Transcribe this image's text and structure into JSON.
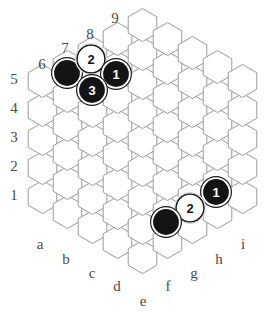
{
  "board": {
    "title": "Hex board diagram",
    "shape": "hexagonal",
    "side_length": 5,
    "column_count": 9,
    "columns": [
      "a",
      "b",
      "c",
      "d",
      "e",
      "f",
      "g",
      "h",
      "i"
    ],
    "column_labels": [
      {
        "label": "a",
        "x": 40,
        "y": 246
      },
      {
        "label": "b",
        "x": 66,
        "y": 261
      },
      {
        "label": "c",
        "x": 92,
        "y": 275
      },
      {
        "label": "d",
        "x": 117,
        "y": 288
      },
      {
        "label": "e",
        "x": 143,
        "y": 303
      },
      {
        "label": "f",
        "x": 168,
        "y": 288
      },
      {
        "label": "g",
        "x": 194,
        "y": 275
      },
      {
        "label": "h",
        "x": 219,
        "y": 261
      },
      {
        "label": "i",
        "x": 243,
        "y": 246
      }
    ],
    "row_labels": [
      {
        "label": "1",
        "x": 14,
        "y": 197
      },
      {
        "label": "2",
        "x": 14,
        "y": 168
      },
      {
        "label": "3",
        "x": 14,
        "y": 139
      },
      {
        "label": "4",
        "x": 14,
        "y": 110
      },
      {
        "label": "5",
        "x": 14,
        "y": 81
      },
      {
        "label": "6",
        "x": 42,
        "y": 66
      },
      {
        "label": "7",
        "x": 65,
        "y": 50
      },
      {
        "label": "8",
        "x": 90,
        "y": 36
      },
      {
        "label": "9",
        "x": 115,
        "y": 20
      }
    ],
    "grid_geometry": {
      "hex_radius": 16.5,
      "hex_width": 28.6,
      "column_step_x": 25.3,
      "row_step_y": 29.2,
      "origin_x": 42.5,
      "origin_y": 197
    },
    "colors": {
      "background": "#ffffff",
      "cell_fill": "#ffffff",
      "cell_stroke": "#9a9a9a",
      "label": "#4a4a4a",
      "black_stone": "#141414",
      "white_stone": "#ffffff",
      "stone_border": "#1a1a1a"
    },
    "stones": [
      {
        "id": "stone-black-b6",
        "color": "black",
        "number": "",
        "cx": 67,
        "cy": 73,
        "r": 14
      },
      {
        "id": "stone-white-2-c7",
        "color": "white",
        "number": "2",
        "cx": 91,
        "cy": 59,
        "r": 14
      },
      {
        "id": "stone-black-1-d7",
        "color": "black",
        "number": "1",
        "cx": 116,
        "cy": 74,
        "r": 14
      },
      {
        "id": "stone-black-3-c6",
        "color": "black",
        "number": "3",
        "cx": 92,
        "cy": 90,
        "r": 14
      },
      {
        "id": "stone-black-1-h2",
        "color": "black",
        "number": "1",
        "cx": 216,
        "cy": 192,
        "r": 14
      },
      {
        "id": "stone-white-2-g2",
        "color": "white",
        "number": "2",
        "cx": 190,
        "cy": 208,
        "r": 14
      },
      {
        "id": "stone-black-f1",
        "color": "black",
        "number": "",
        "cx": 166,
        "cy": 222,
        "r": 14
      }
    ],
    "cells": [
      {
        "col": 0,
        "cx": 42.5,
        "cy": 197
      },
      {
        "col": 0,
        "cx": 42.5,
        "cy": 168
      },
      {
        "col": 0,
        "cx": 42.5,
        "cy": 139
      },
      {
        "col": 0,
        "cx": 42.5,
        "cy": 110
      },
      {
        "col": 0,
        "cx": 42.5,
        "cy": 81
      },
      {
        "col": 1,
        "cx": 67.5,
        "cy": 212
      },
      {
        "col": 1,
        "cx": 67.5,
        "cy": 183
      },
      {
        "col": 1,
        "cx": 67.5,
        "cy": 154
      },
      {
        "col": 1,
        "cx": 67.5,
        "cy": 125
      },
      {
        "col": 1,
        "cx": 67.5,
        "cy": 96
      },
      {
        "col": 1,
        "cx": 67.5,
        "cy": 67
      },
      {
        "col": 2,
        "cx": 92.5,
        "cy": 227
      },
      {
        "col": 2,
        "cx": 92.5,
        "cy": 198
      },
      {
        "col": 2,
        "cx": 92.5,
        "cy": 169
      },
      {
        "col": 2,
        "cx": 92.5,
        "cy": 140
      },
      {
        "col": 2,
        "cx": 92.5,
        "cy": 111
      },
      {
        "col": 2,
        "cx": 92.5,
        "cy": 82
      },
      {
        "col": 2,
        "cx": 92.5,
        "cy": 53
      },
      {
        "col": 3,
        "cx": 117.5,
        "cy": 242
      },
      {
        "col": 3,
        "cx": 117.5,
        "cy": 213
      },
      {
        "col": 3,
        "cx": 117.5,
        "cy": 184
      },
      {
        "col": 3,
        "cx": 117.5,
        "cy": 155
      },
      {
        "col": 3,
        "cx": 117.5,
        "cy": 126
      },
      {
        "col": 3,
        "cx": 117.5,
        "cy": 97
      },
      {
        "col": 3,
        "cx": 117.5,
        "cy": 68
      },
      {
        "col": 3,
        "cx": 117.5,
        "cy": 39
      },
      {
        "col": 4,
        "cx": 142.5,
        "cy": 257
      },
      {
        "col": 4,
        "cx": 142.5,
        "cy": 228
      },
      {
        "col": 4,
        "cx": 142.5,
        "cy": 199
      },
      {
        "col": 4,
        "cx": 142.5,
        "cy": 170
      },
      {
        "col": 4,
        "cx": 142.5,
        "cy": 141
      },
      {
        "col": 4,
        "cx": 142.5,
        "cy": 112
      },
      {
        "col": 4,
        "cx": 142.5,
        "cy": 83
      },
      {
        "col": 4,
        "cx": 142.5,
        "cy": 54
      },
      {
        "col": 4,
        "cx": 142.5,
        "cy": 25
      },
      {
        "col": 5,
        "cx": 167.5,
        "cy": 242
      },
      {
        "col": 5,
        "cx": 167.5,
        "cy": 213
      },
      {
        "col": 5,
        "cx": 167.5,
        "cy": 184
      },
      {
        "col": 5,
        "cx": 167.5,
        "cy": 155
      },
      {
        "col": 5,
        "cx": 167.5,
        "cy": 126
      },
      {
        "col": 5,
        "cx": 167.5,
        "cy": 97
      },
      {
        "col": 5,
        "cx": 167.5,
        "cy": 68
      },
      {
        "col": 5,
        "cx": 167.5,
        "cy": 39
      },
      {
        "col": 6,
        "cx": 192.5,
        "cy": 227
      },
      {
        "col": 6,
        "cx": 192.5,
        "cy": 198
      },
      {
        "col": 6,
        "cx": 192.5,
        "cy": 169
      },
      {
        "col": 6,
        "cx": 192.5,
        "cy": 140
      },
      {
        "col": 6,
        "cx": 192.5,
        "cy": 111
      },
      {
        "col": 6,
        "cx": 192.5,
        "cy": 82
      },
      {
        "col": 6,
        "cx": 192.5,
        "cy": 53
      },
      {
        "col": 7,
        "cx": 217.5,
        "cy": 212
      },
      {
        "col": 7,
        "cx": 217.5,
        "cy": 183
      },
      {
        "col": 7,
        "cx": 217.5,
        "cy": 154
      },
      {
        "col": 7,
        "cx": 217.5,
        "cy": 125
      },
      {
        "col": 7,
        "cx": 217.5,
        "cy": 96
      },
      {
        "col": 7,
        "cx": 217.5,
        "cy": 67
      },
      {
        "col": 8,
        "cx": 242.5,
        "cy": 197
      },
      {
        "col": 8,
        "cx": 242.5,
        "cy": 168
      },
      {
        "col": 8,
        "cx": 242.5,
        "cy": 139
      },
      {
        "col": 8,
        "cx": 242.5,
        "cy": 110
      },
      {
        "col": 8,
        "cx": 242.5,
        "cy": 81
      }
    ]
  }
}
